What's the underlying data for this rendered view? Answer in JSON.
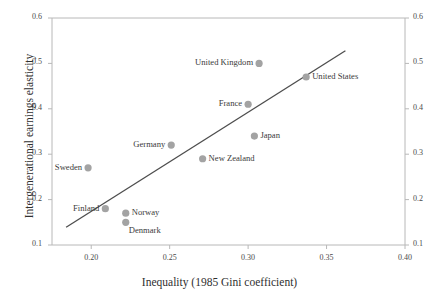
{
  "figure": {
    "cut_header_text": "",
    "frame_color": "#b8b8b8",
    "marker_color": "#a3a3a3",
    "trendline_color": "#4d4d4d"
  },
  "chart_data": {
    "type": "scatter",
    "title": "",
    "xlabel": "Inequality (1985 Gini coefficient)",
    "ylabel": "Intergenerational earnings elasticity",
    "xlim": [
      0.175,
      0.4
    ],
    "ylim": [
      0.1,
      0.6
    ],
    "xticks": [
      0.2,
      0.25,
      0.3,
      0.35,
      0.4
    ],
    "xtick_labels": [
      "0.20",
      "0.25",
      "0.30",
      "0.35",
      "0.40"
    ],
    "yticks": [
      0.1,
      0.2,
      0.3,
      0.4,
      0.5,
      0.6
    ],
    "ytick_labels": [
      "0.1",
      "0.2",
      "0.3",
      "0.4",
      "0.5",
      "0.6"
    ],
    "ytick_labels_right": [
      "0.1",
      "0.2",
      "0.3",
      "0.4",
      "0.5",
      "0.6"
    ],
    "grid": false,
    "legend": "none",
    "dual_y_axis": true,
    "points": [
      {
        "name": "Sweden",
        "x": 0.198,
        "y": 0.27,
        "label_side": "left"
      },
      {
        "name": "Finland",
        "x": 0.209,
        "y": 0.18,
        "label_side": "left"
      },
      {
        "name": "Norway",
        "x": 0.222,
        "y": 0.17,
        "label_side": "right"
      },
      {
        "name": "Denmark",
        "x": 0.222,
        "y": 0.15,
        "label_side": "below-right"
      },
      {
        "name": "Germany",
        "x": 0.251,
        "y": 0.32,
        "label_side": "left"
      },
      {
        "name": "New Zealand",
        "x": 0.271,
        "y": 0.29,
        "label_side": "right"
      },
      {
        "name": "France",
        "x": 0.3,
        "y": 0.41,
        "label_side": "left"
      },
      {
        "name": "Japan",
        "x": 0.304,
        "y": 0.34,
        "label_side": "right"
      },
      {
        "name": "United Kingdom",
        "x": 0.307,
        "y": 0.5,
        "label_side": "left"
      },
      {
        "name": "United States",
        "x": 0.337,
        "y": 0.47,
        "label_side": "right"
      }
    ],
    "trendline": {
      "x0": 0.184,
      "y0": 0.139,
      "x1": 0.362,
      "y1": 0.528
    }
  }
}
